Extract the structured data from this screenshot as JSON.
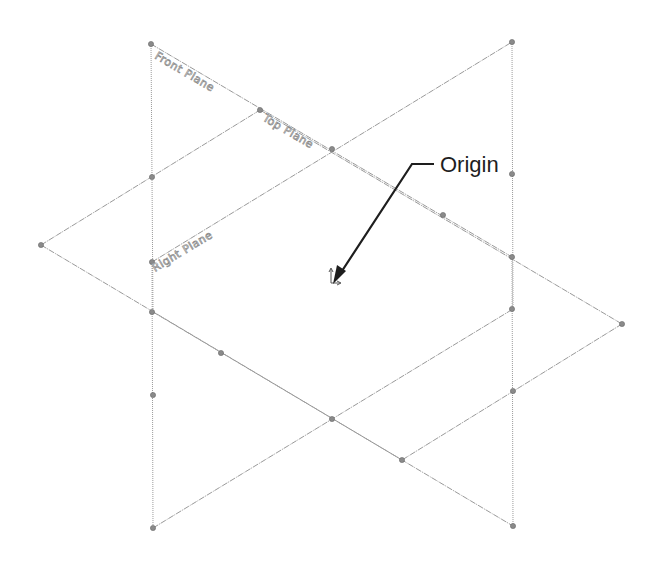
{
  "diagram": {
    "type": "cad-reference-planes-isometric",
    "planes": [
      {
        "id": "front",
        "label": "Front Plane",
        "color": "#9a9a9a"
      },
      {
        "id": "top",
        "label": "Top Plane",
        "color": "#9a9a9a"
      },
      {
        "id": "right",
        "label": "Right Plane",
        "color": "#9a9a9a"
      }
    ],
    "callout": {
      "label": "Origin",
      "text_color": "#1e1e1e"
    },
    "origin_icon": "origin-triad-icon"
  }
}
